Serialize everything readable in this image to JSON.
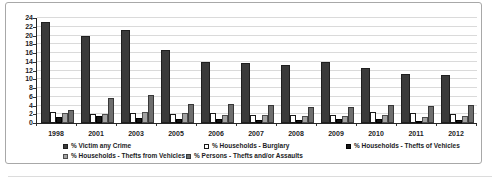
{
  "chart_data": {
    "type": "bar",
    "title": "",
    "categories": [
      "1998",
      "2001",
      "2003",
      "2005",
      "2006",
      "2007",
      "2008",
      "2009",
      "2010",
      "2011",
      "2012"
    ],
    "series": [
      {
        "name": "% Victim any Crime",
        "color": "#3a3a3a",
        "border": "#1f1f1f",
        "values": [
          23.0,
          19.9,
          21.2,
          16.7,
          13.9,
          13.7,
          13.2,
          14.0,
          12.5,
          11.2,
          10.9
        ]
      },
      {
        "name": "% Households - Burglary",
        "color": "#ffffff",
        "border": "#1a1a1a",
        "values": [
          2.4,
          2.0,
          2.2,
          2.0,
          2.2,
          1.8,
          1.9,
          1.9,
          2.4,
          2.2,
          2.0
        ]
      },
      {
        "name": "% Households - Thefts of Vehicles",
        "color": "#161616",
        "border": "#000000",
        "values": [
          1.4,
          1.5,
          1.2,
          0.9,
          0.9,
          0.7,
          0.6,
          0.8,
          0.8,
          0.5,
          0.6
        ]
      },
      {
        "name": "% Households - Thefts from Vehicles",
        "color": "#a3a3a3",
        "border": "#4d4d4d",
        "values": [
          2.2,
          2.1,
          2.6,
          2.2,
          1.8,
          1.9,
          1.5,
          1.7,
          1.8,
          1.4,
          1.5
        ]
      },
      {
        "name": "% Persons - Thefts and/or Assaults",
        "color": "#6e6e6e",
        "border": "#383838",
        "values": [
          2.9,
          5.7,
          6.4,
          4.4,
          4.3,
          4.1,
          3.7,
          3.6,
          4.2,
          3.9,
          4.0
        ]
      }
    ],
    "xlabel": "",
    "ylabel": "",
    "ylim": [
      0,
      24
    ],
    "ytick_step": 2,
    "grid": true,
    "legend_position": "bottom",
    "colors": {
      "gridline": "#dadada",
      "axis": "#262626",
      "text": "#1c1c24",
      "figure_border": "#a8a8a8"
    }
  }
}
